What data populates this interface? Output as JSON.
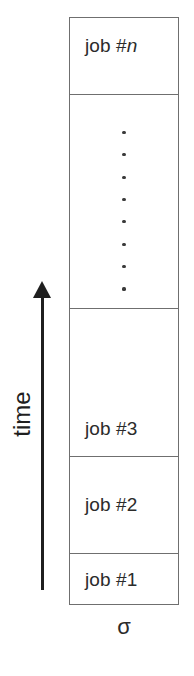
{
  "diagram": {
    "axis": {
      "label": "time",
      "direction": "upward",
      "arrow_icon": "up-arrow-icon"
    },
    "sequence_caption": "σ",
    "stack": {
      "cells": [
        {
          "id": "job-n",
          "text_prefix": "job #",
          "text_suffix": "n",
          "suffix_style": "italic",
          "full_text": "job #n"
        },
        {
          "id": "ellipsis",
          "text_prefix": "",
          "text_suffix": "",
          "suffix_style": "none",
          "full_text": ""
        },
        {
          "id": "job-3",
          "text_prefix": "job #",
          "text_suffix": "3",
          "suffix_style": "normal",
          "full_text": "job #3"
        },
        {
          "id": "job-2",
          "text_prefix": "job #",
          "text_suffix": "2",
          "suffix_style": "normal",
          "full_text": "job #2"
        },
        {
          "id": "job-1",
          "text_prefix": "job #",
          "text_suffix": "1",
          "suffix_style": "normal",
          "full_text": "job #1"
        }
      ],
      "ellipsis_dot_count": 8,
      "ellipsis_symbol": "vertical-ellipsis"
    },
    "colors": {
      "box_border": "#6f6f6f",
      "box_fill": "#ffffff",
      "text": "#2b2b2b",
      "arrow": "#1f1f1f",
      "dot": "#3a3a3a",
      "background": "#ffffff"
    }
  }
}
